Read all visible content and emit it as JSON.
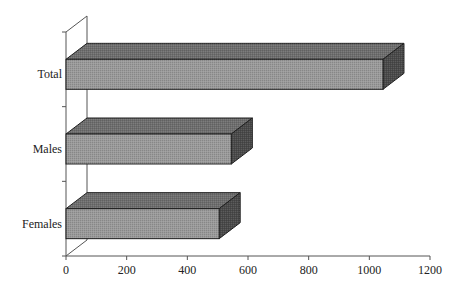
{
  "chart_data": {
    "type": "bar",
    "orientation": "horizontal",
    "style": "3d",
    "title": "",
    "xlabel": "",
    "ylabel": "",
    "categories": [
      "Total",
      "Males",
      "Females"
    ],
    "values": [
      1045,
      545,
      505
    ],
    "xlim": [
      0,
      1200
    ],
    "x_ticks": [
      0,
      200,
      400,
      600,
      800,
      1000,
      1200
    ],
    "grid": false,
    "legend": null,
    "colors": {
      "front": "#9a9a9a",
      "top": "#6e6e6e",
      "side": "#4a4a4a",
      "outline": "#1e1e1e",
      "axis": "#555555"
    }
  }
}
